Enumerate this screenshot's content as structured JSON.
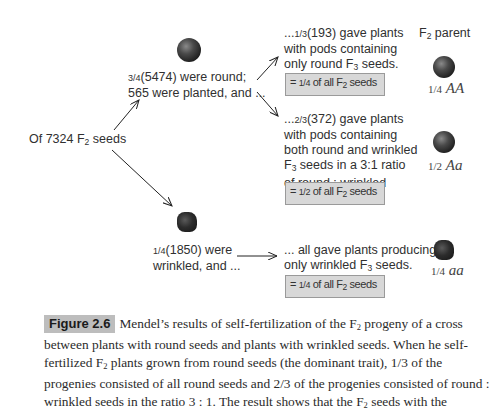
{
  "figure": {
    "root": {
      "text_prefix": "Of 7324 F",
      "sub": "2",
      "text_suffix": " seeds"
    },
    "round_branch": {
      "line1_frac": "3/4",
      "line1_rest": "(5474) were round;",
      "line2": "565 were planted, and ..."
    },
    "wrinkled_branch": {
      "line1_frac": "1/4",
      "line1_rest": "(1850) were",
      "line2": "wrinkled, and ..."
    },
    "outcomes": [
      {
        "lead": "...",
        "frac": "1/3",
        "line1_rest": "(193) gave plants",
        "line2": "with pods containing",
        "line3_prefix": "only round F",
        "line3_sub": "3",
        "line3_suffix": " seeds.",
        "box_prefix": "= ",
        "box_frac": "1/4",
        "box_mid": " of all F",
        "box_sub": "2",
        "box_suffix": " seeds",
        "genotype_frac": "1/4",
        "genotype": "AA"
      },
      {
        "lead": "...",
        "frac": "2/3",
        "line1_rest": "(372) gave plants",
        "line2": "with pods containing",
        "line3": "both round and wrinkled",
        "line4_prefix": "F",
        "line4_sub": "3",
        "line4_suffix": " seeds in a 3:1 ratio",
        "line5": "of round : wrinkled",
        "box_prefix": "= ",
        "box_frac": "1/2",
        "box_mid": " of all F",
        "box_sub": "2",
        "box_suffix": " seeds",
        "genotype_frac": "1/2",
        "genotype": "Aa"
      },
      {
        "line1": "... all gave plants producing",
        "line2_prefix": "only wrinkled F",
        "line2_sub": "3",
        "line2_suffix": " seeds.",
        "box_prefix": "= ",
        "box_frac": "1/4",
        "box_mid": " of all F",
        "box_sub": "2",
        "box_suffix": " seeds",
        "genotype_frac": "1/4",
        "genotype": "aa"
      }
    ],
    "column_header": {
      "prefix": "F",
      "sub": "2",
      "suffix": " parent"
    }
  },
  "caption": {
    "label": "Figure 2.6",
    "text_1": "Mendel’s results of self-fertilization of the F",
    "sub_1": "2",
    "text_2": " progeny of a cross between plants with round seeds and plants with wrinkled seeds. When he self-fertilized F",
    "sub_2": "2",
    "text_3": " plants grown from round seeds (the dominant trait), 1/3 of the progenies consisted of all round seeds and 2/3 of the progenies consisted of round : wrinkled seeds in the ratio 3 : 1. The result shows that the F",
    "sub_3": "2",
    "text_4": " seeds with the"
  }
}
